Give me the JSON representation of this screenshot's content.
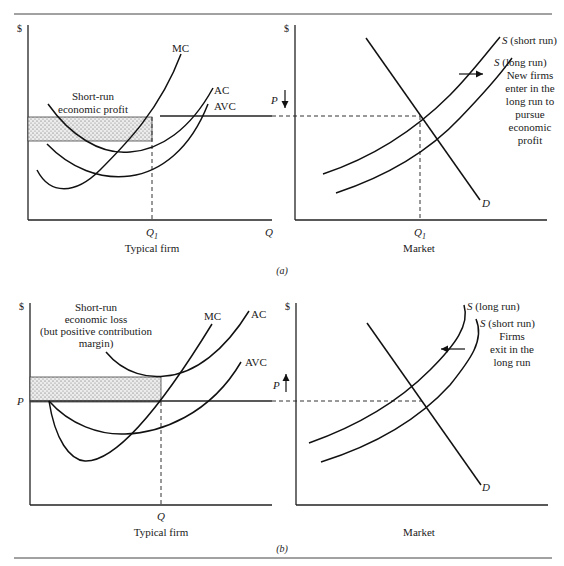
{
  "figure": {
    "panel_a": {
      "caption": "(a)",
      "firm": {
        "y_axis": "$",
        "x_axis": "Q",
        "x_tick": "Q",
        "x_tick_sub": "1",
        "title": "Typical firm",
        "curves": [
          "MC",
          "AC",
          "AVC"
        ],
        "shaded_label_line1": "Short-run",
        "shaded_label_line2": "economic profit",
        "price_line_label": "P",
        "price_arrow": "down"
      },
      "market": {
        "y_axis": "$",
        "x_tick": "Q",
        "x_tick_sub": "1",
        "title": "Market",
        "supply_short": "S",
        "supply_short_suffix": " (short run)",
        "supply_long": "S",
        "supply_long_suffix": " (long run)",
        "demand": "D",
        "note_lines": [
          "New firms",
          "enter in the",
          "long run to",
          "pursue",
          "economic",
          "profit"
        ],
        "shift_arrow": "right"
      }
    },
    "panel_b": {
      "caption": "(b)",
      "firm": {
        "y_axis": "$",
        "x_tick": "Q",
        "title": "Typical firm",
        "curves": [
          "MC",
          "AC",
          "AVC"
        ],
        "price_label": "P",
        "shaded_label_lines": [
          "Short-run",
          "economic loss",
          "(but positive contribution",
          "margin)"
        ],
        "price_arrow_label": "P",
        "price_arrow": "up"
      },
      "market": {
        "y_axis": "$",
        "title": "Market",
        "supply_long": "S",
        "supply_long_suffix": " (long run)",
        "supply_short": "S",
        "supply_short_suffix": " (short run)",
        "demand": "D",
        "note_lines": [
          "Firms",
          "exit in the",
          "long run"
        ],
        "shift_arrow": "left"
      }
    }
  }
}
